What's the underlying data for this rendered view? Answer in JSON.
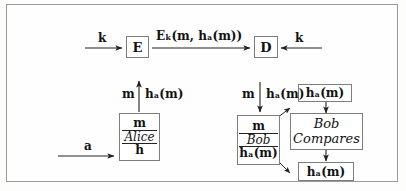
{
  "diagram": {
    "frame": {
      "border_color": "#9a9a9a",
      "background": "#fefefe"
    },
    "ink_color": "#111111",
    "box_border_color": "#7d7d7d",
    "nodes": {
      "encrypt": {
        "label": "E",
        "name": "encryption-box"
      },
      "decrypt": {
        "label": "D",
        "name": "decryption-box"
      },
      "alice": {
        "top": "m",
        "middle": "Alice",
        "bottom": "h"
      },
      "bob": {
        "top": "m",
        "middle": "Bob",
        "bottom": "hₐ(m)"
      },
      "bob_compares": {
        "line1": "Bob",
        "line2": "Compares"
      },
      "hash_top": {
        "label": "hₐ(m)"
      },
      "hash_bottom": {
        "label": "hₐ(m)"
      }
    },
    "labels": {
      "key_left": "k",
      "key_right": "k",
      "ciphertext": "Eₖ(m, hₐ(m))",
      "alice_in": "a",
      "alice_up_left": "m",
      "alice_up_right": "hₐ(m)",
      "bob_down_left": "m",
      "bob_down_right": "hₐ(m)"
    },
    "arrows": [
      {
        "name": "key-into-encrypt-arrow",
        "direction": "right"
      },
      {
        "name": "ciphertext-arrow",
        "direction": "right"
      },
      {
        "name": "key-into-decrypt-arrow",
        "direction": "left"
      },
      {
        "name": "alice-output-arrow",
        "direction": "up"
      },
      {
        "name": "bob-input-arrow",
        "direction": "down"
      },
      {
        "name": "message-a-arrow",
        "direction": "right"
      },
      {
        "name": "hash-top-to-compares-arrow",
        "direction": "down"
      },
      {
        "name": "compares-to-hash-bottom-arrow",
        "direction": "down"
      },
      {
        "name": "bob-to-compares-diagonal",
        "direction": "up-right"
      },
      {
        "name": "bob-to-hash-bottom-diagonal",
        "direction": "down-right"
      }
    ]
  }
}
